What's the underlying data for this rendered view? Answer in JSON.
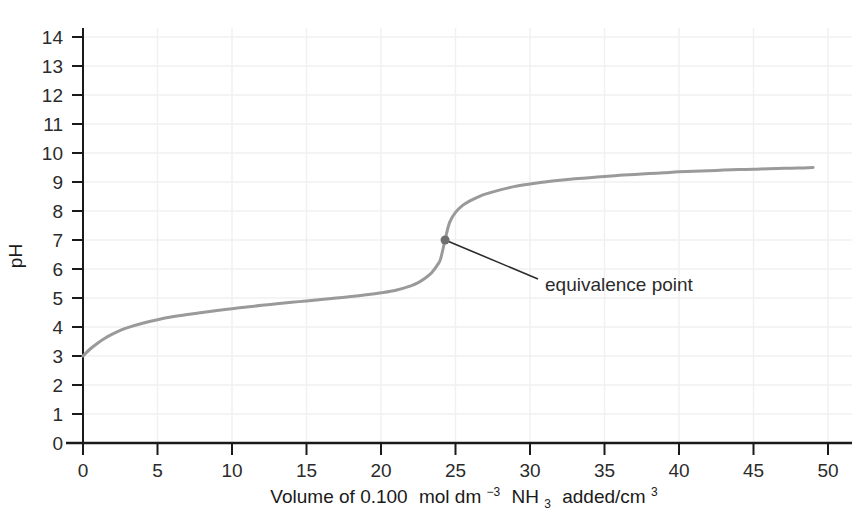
{
  "chart_data": {
    "type": "line",
    "title": "",
    "xlabel": "Volume of 0.100 mol dm⁻³ NH₃ added/cm³",
    "ylabel": "pH",
    "xlim": [
      0,
      50
    ],
    "ylim": [
      0,
      14
    ],
    "grid": true,
    "legend": null,
    "xticks": [
      0,
      5,
      10,
      15,
      20,
      25,
      30,
      35,
      40,
      45,
      50
    ],
    "yticks": [
      0,
      1,
      2,
      3,
      4,
      5,
      6,
      7,
      8,
      9,
      10,
      11,
      12,
      13,
      14
    ],
    "series": [
      {
        "name": "titration curve",
        "color": "#9a9a9a",
        "x": [
          0,
          0.5,
          1,
          1.5,
          2,
          2.5,
          3,
          4,
          5,
          6,
          7,
          8,
          9,
          10,
          11,
          12,
          13,
          14,
          15,
          16,
          17,
          18,
          19,
          20,
          21,
          22,
          22.5,
          23,
          23.4,
          23.8,
          24,
          24.3,
          24.6,
          25,
          25.5,
          26,
          26.5,
          27,
          28,
          29,
          30,
          31,
          32,
          33,
          34,
          35,
          36,
          37,
          38,
          39,
          40,
          41,
          42,
          43,
          44,
          45,
          46,
          47,
          48,
          49
        ],
        "y": [
          3.0,
          3.25,
          3.45,
          3.62,
          3.76,
          3.88,
          3.98,
          4.13,
          4.25,
          4.35,
          4.43,
          4.5,
          4.57,
          4.63,
          4.69,
          4.75,
          4.8,
          4.85,
          4.9,
          4.95,
          5.0,
          5.05,
          5.11,
          5.18,
          5.27,
          5.42,
          5.53,
          5.7,
          5.87,
          6.15,
          6.35,
          7.0,
          7.6,
          7.95,
          8.2,
          8.36,
          8.48,
          8.58,
          8.73,
          8.85,
          8.93,
          9.0,
          9.06,
          9.11,
          9.15,
          9.19,
          9.23,
          9.26,
          9.29,
          9.32,
          9.35,
          9.37,
          9.39,
          9.41,
          9.43,
          9.44,
          9.46,
          9.47,
          9.48,
          9.5
        ]
      }
    ],
    "annotations": [
      {
        "name": "equivalence-point",
        "label": "equivalence point",
        "point_x": 24.3,
        "point_y": 7.0,
        "marker": "dot",
        "marker_color": "#6f6f6f",
        "leader_color": "#2b2b2b"
      }
    ],
    "axis_color": "#1a1a1a",
    "grid_color": "#f0f0f0"
  },
  "xlabel_parts": {
    "p1": "Volume of 0.100",
    "p2": "mol dm",
    "sup1": "−3",
    "p3": "NH",
    "sub1": "3",
    "p4": "added/cm",
    "sup2": "3"
  }
}
